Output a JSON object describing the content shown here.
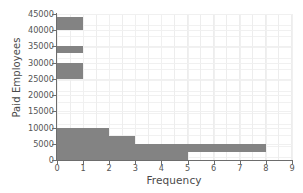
{
  "chart_data": {
    "type": "bar",
    "title": "",
    "xlabel": "Frequency",
    "ylabel": "Paid Employees",
    "orientation": "horizontal-step-histogram",
    "xlim": [
      0,
      9
    ],
    "ylim": [
      0,
      45000
    ],
    "x_ticks": [
      0,
      1,
      2,
      3,
      4,
      5,
      6,
      7,
      8,
      9
    ],
    "x_tick_labels": [
      "0",
      "1",
      "2",
      "3",
      "4",
      "5",
      "6",
      "7",
      "8",
      "9"
    ],
    "y_ticks": [
      0,
      5000,
      10000,
      15000,
      20000,
      25000,
      30000,
      35000,
      40000,
      45000
    ],
    "y_tick_labels": [
      "0",
      "5000",
      "10000",
      "15000",
      "20000",
      "25000",
      "30000",
      "35000",
      "40000",
      "45000"
    ],
    "grid": true,
    "legend": "none",
    "bar_color": "#838383",
    "axis_color": "#6d6d6d",
    "grid_color": "#efefef",
    "bars": [
      {
        "name": "band-40000-44000",
        "x_start": 0,
        "x_end": 1,
        "y_low": 40000,
        "y_high": 44000
      },
      {
        "name": "band-33000-35000",
        "x_start": 0,
        "x_end": 1,
        "y_low": 33000,
        "y_high": 35000
      },
      {
        "name": "band-25000-30000",
        "x_start": 0,
        "x_end": 1,
        "y_low": 25000,
        "y_high": 30000
      },
      {
        "name": "step-0-2-10000",
        "x_start": 0,
        "x_end": 2,
        "y_low": 0,
        "y_high": 10000
      },
      {
        "name": "step-2-3-7500",
        "x_start": 2,
        "x_end": 3,
        "y_low": 0,
        "y_high": 7500
      },
      {
        "name": "step-3-5-5000",
        "x_start": 3,
        "x_end": 5,
        "y_low": 0,
        "y_high": 5000
      },
      {
        "name": "band-5-8-2500-5000",
        "x_start": 5,
        "x_end": 8,
        "y_low": 2500,
        "y_high": 5000
      }
    ]
  }
}
